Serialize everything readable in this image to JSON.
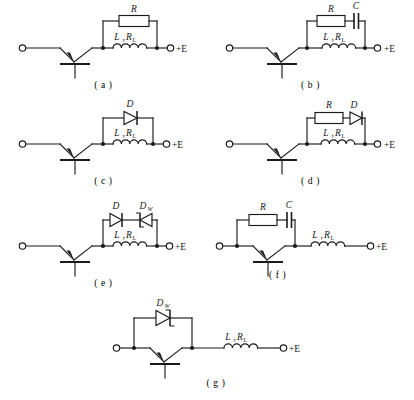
{
  "figure": {
    "type": "circuit-schematic-sheet",
    "supply_label": "+E",
    "inductor_label": "L",
    "inductor_label_sep": ",",
    "inductor_resistance": "R",
    "inductor_resistance_sub": "L",
    "panels": [
      {
        "id": "a",
        "caption": "( a )",
        "protection": "parallel resistor across the inductive load",
        "components": [
          {
            "name": "resistor",
            "label": "R",
            "sub": ""
          }
        ],
        "load": {
          "label": "L",
          "sep": ",",
          "res": "R",
          "res_sub": "L"
        },
        "terminals": {
          "input": "",
          "supply": "+E"
        }
      },
      {
        "id": "b",
        "caption": "( b )",
        "protection": "series RC snubber across the inductive load",
        "components": [
          {
            "name": "resistor",
            "label": "R",
            "sub": ""
          },
          {
            "name": "capacitor",
            "label": "C",
            "sub": ""
          }
        ],
        "load": {
          "label": "L",
          "sep": ",",
          "res": "R",
          "res_sub": "L"
        },
        "terminals": {
          "input": "",
          "supply": "+E"
        }
      },
      {
        "id": "c",
        "caption": "( c )",
        "protection": "freewheeling diode across the inductive load",
        "components": [
          {
            "name": "diode",
            "label": "D",
            "sub": ""
          }
        ],
        "load": {
          "label": "L",
          "sep": ",",
          "res": "R",
          "res_sub": "L"
        },
        "terminals": {
          "input": "",
          "supply": "+E"
        }
      },
      {
        "id": "d",
        "caption": "( d )",
        "protection": "resistor in series with freewheeling diode across the inductive load",
        "components": [
          {
            "name": "resistor",
            "label": "R",
            "sub": ""
          },
          {
            "name": "diode",
            "label": "D",
            "sub": ""
          }
        ],
        "load": {
          "label": "L",
          "sep": ",",
          "res": "R",
          "res_sub": "L"
        },
        "terminals": {
          "input": "",
          "supply": "+E"
        }
      },
      {
        "id": "e",
        "caption": "( e )",
        "protection": "diode in series with back-to-back zener diode across the inductive load",
        "components": [
          {
            "name": "diode",
            "label": "D",
            "sub": ""
          },
          {
            "name": "zener-diode",
            "label": "D",
            "sub": "W"
          }
        ],
        "load": {
          "label": "L",
          "sep": ",",
          "res": "R",
          "res_sub": "L"
        },
        "terminals": {
          "input": "",
          "supply": "+E"
        }
      },
      {
        "id": "f",
        "caption": "( f )",
        "protection": "series RC snubber across the transistor",
        "components": [
          {
            "name": "resistor",
            "label": "R",
            "sub": ""
          },
          {
            "name": "capacitor",
            "label": "C",
            "sub": ""
          }
        ],
        "load": {
          "label": "L",
          "sep": ",",
          "res": "R",
          "res_sub": "L"
        },
        "terminals": {
          "input": "",
          "supply": "+E"
        }
      },
      {
        "id": "g",
        "caption": "( g )",
        "protection": "zener diode across the transistor",
        "components": [
          {
            "name": "zener-diode",
            "label": "D",
            "sub": "W"
          }
        ],
        "load": {
          "label": "L",
          "sep": ",",
          "res": "R",
          "res_sub": "L"
        },
        "terminals": {
          "input": "",
          "supply": "+E"
        }
      }
    ]
  },
  "colors": {
    "ink": "#1a1a1a",
    "paper": "#ffffff"
  }
}
